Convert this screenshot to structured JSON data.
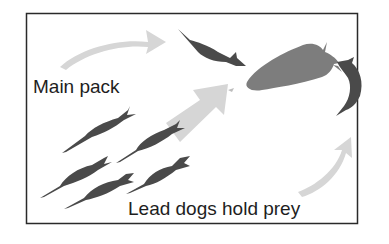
{
  "diagram": {
    "labels": {
      "main_pack": "Main pack",
      "lead_dogs": "Lead dogs hold prey"
    },
    "colors": {
      "border": "#2a2a2a",
      "dog": "#4a4a4a",
      "prey": "#7d7d7d",
      "arrow": "#d6d6d6",
      "text": "#1e1e1e"
    }
  }
}
